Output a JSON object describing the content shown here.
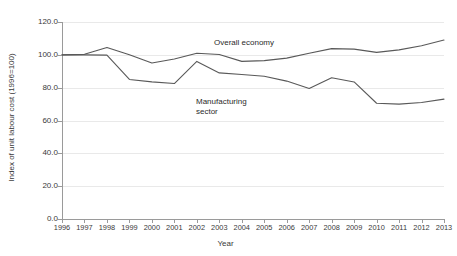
{
  "chart_data": {
    "type": "line",
    "title": "",
    "xlabel": "Year",
    "ylabel": "Index of unit labour cost (1996=100)",
    "x": [
      1996,
      1997,
      1998,
      1999,
      2000,
      2001,
      2002,
      2003,
      2004,
      2005,
      2006,
      2007,
      2008,
      2009,
      2010,
      2011,
      2012,
      2013
    ],
    "categories": [
      "1996",
      "1997",
      "1998",
      "1999",
      "2000",
      "2001",
      "2002",
      "2003",
      "2004",
      "2005",
      "2006",
      "2007",
      "2008",
      "2009",
      "2010",
      "2011",
      "2012",
      "2013"
    ],
    "xlim": [
      1996,
      2013
    ],
    "ylim": [
      0,
      120
    ],
    "yticks": [
      0,
      20,
      40,
      60,
      80,
      100,
      120
    ],
    "ytick_labels": [
      "0.0",
      "20.0",
      "40.0",
      "60.0",
      "80.0",
      "100.0",
      "120.0"
    ],
    "grid": true,
    "legend": "annotations-inline",
    "series": [
      {
        "name": "Overall economy",
        "color": "#595959",
        "values": [
          100.0,
          100.3,
          104.5,
          100.0,
          95.0,
          97.5,
          101.0,
          100.2,
          96.0,
          96.5,
          98.0,
          101.0,
          103.8,
          103.5,
          101.5,
          103.0,
          105.5,
          109.0
        ]
      },
      {
        "name": "Manufacturing sector",
        "color": "#595959",
        "values": [
          100.0,
          100.0,
          99.8,
          85.0,
          83.5,
          82.5,
          96.0,
          89.0,
          88.0,
          87.0,
          84.0,
          79.5,
          86.0,
          83.5,
          70.5,
          70.0,
          71.0,
          73.0
        ]
      }
    ],
    "annotations": [
      {
        "id": "overall",
        "text": "Overall economy"
      },
      {
        "id": "manufacturing",
        "text": "Manufacturing\nsector"
      }
    ]
  },
  "axis": {
    "x_title": "Year",
    "y_title": "Index of unit labour cost (1996=100)"
  }
}
